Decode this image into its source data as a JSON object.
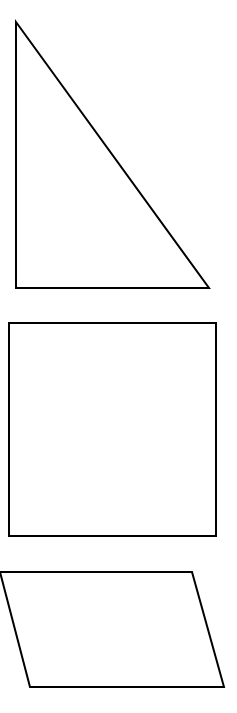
{
  "canvas": {
    "width": 237,
    "height": 713,
    "background_color": "#ffffff"
  },
  "figure": {
    "stroke_color": "#000000",
    "fill_color": "none",
    "stroke_width": 2
  },
  "shapes": [
    {
      "id": "right-triangle",
      "name": "Right triangle",
      "type": "polygon",
      "order": 1,
      "vertex_count": 3,
      "points": "16,22 16,288 209,288",
      "vertices": [
        {
          "label": "apex",
          "x": 16,
          "y": 22
        },
        {
          "label": "bottom-left",
          "x": 16,
          "y": 288
        },
        {
          "label": "bottom-right",
          "x": 209,
          "y": 288
        }
      ],
      "bbox": {
        "x": 16,
        "y": 22,
        "width": 193,
        "height": 266
      },
      "clipped": false
    },
    {
      "id": "square",
      "name": "Square",
      "type": "polygon",
      "order": 2,
      "vertex_count": 4,
      "points": "9,323 216,323 216,536 9,536",
      "vertices": [
        {
          "label": "top-left",
          "x": 9,
          "y": 323
        },
        {
          "label": "top-right",
          "x": 216,
          "y": 323
        },
        {
          "label": "bottom-right",
          "x": 216,
          "y": 536
        },
        {
          "label": "bottom-left",
          "x": 9,
          "y": 536
        }
      ],
      "bbox": {
        "x": 9,
        "y": 323,
        "width": 207,
        "height": 213
      },
      "clipped": false
    },
    {
      "id": "parallelogram",
      "name": "Parallelogram",
      "type": "polygon",
      "order": 3,
      "vertex_count": 4,
      "points": "0,572 192,572 224,687 30,687",
      "vertices": [
        {
          "label": "top-left",
          "x": 0,
          "y": 572
        },
        {
          "label": "top-right",
          "x": 192,
          "y": 572
        },
        {
          "label": "bottom-right",
          "x": 224,
          "y": 687
        },
        {
          "label": "bottom-left",
          "x": 30,
          "y": 687
        }
      ],
      "bbox": {
        "x": 0,
        "y": 572,
        "width": 224,
        "height": 115
      },
      "clipped": true,
      "clipped_edge": "left"
    }
  ]
}
